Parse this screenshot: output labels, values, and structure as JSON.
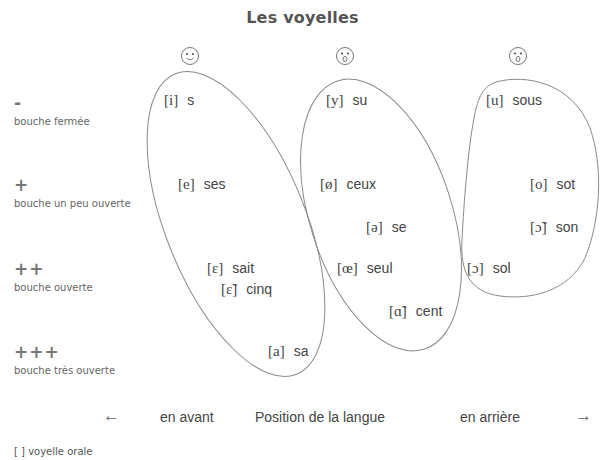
{
  "title": "Les voyelles",
  "faces": [
    {
      "name": "smiling-face-icon",
      "x": 180,
      "y": 46,
      "mouth": "smile"
    },
    {
      "name": "rounded-mouth-face-icon",
      "x": 335,
      "y": 46,
      "mouth": "round"
    },
    {
      "name": "rounded-mouth-face-icon",
      "x": 508,
      "y": 46,
      "mouth": "round"
    }
  ],
  "rows": [
    {
      "symbol": "-",
      "label": "bouche fermée",
      "y": 96
    },
    {
      "symbol": "+",
      "label": "bouche un peu ouverte",
      "y": 178
    },
    {
      "symbol": "++",
      "label": "bouche ouverte",
      "y": 262
    },
    {
      "symbol": "+++",
      "label": "bouche très ouverte",
      "y": 345
    }
  ],
  "groups": [
    {
      "name": "front-unrounded",
      "vowels": [
        {
          "ipa": "[i]",
          "word": "s",
          "x": 164,
          "y": 92
        },
        {
          "ipa": "[e]",
          "word": "ses",
          "x": 178,
          "y": 176
        },
        {
          "ipa": "[ɛ]",
          "word": "sait",
          "x": 207,
          "y": 260
        },
        {
          "ipa": "[ɛ̃]",
          "word": "cinq",
          "x": 221,
          "y": 281
        },
        {
          "ipa": "[a]",
          "word": "sa",
          "x": 268,
          "y": 343
        }
      ]
    },
    {
      "name": "front-rounded",
      "vowels": [
        {
          "ipa": "[y]",
          "word": "su",
          "x": 326,
          "y": 92
        },
        {
          "ipa": "[ø]",
          "word": "ceux",
          "x": 320,
          "y": 176
        },
        {
          "ipa": "[ə]",
          "word": "se",
          "x": 366,
          "y": 219
        },
        {
          "ipa": "[œ]",
          "word": "seul",
          "x": 337,
          "y": 260
        },
        {
          "ipa": "[ɑ̃]",
          "word": "cent",
          "x": 389,
          "y": 303
        }
      ]
    },
    {
      "name": "back-rounded",
      "vowels": [
        {
          "ipa": "[u]",
          "word": "sous",
          "x": 486,
          "y": 92
        },
        {
          "ipa": "[o]",
          "word": "sot",
          "x": 530,
          "y": 176
        },
        {
          "ipa": "[ɔ̃]",
          "word": "son",
          "x": 530,
          "y": 219
        },
        {
          "ipa": "[ɔ]",
          "word": "sol",
          "x": 467,
          "y": 260
        }
      ]
    }
  ],
  "axis": {
    "left_arrow": "←",
    "front": "en avant",
    "title": "Position de la langue",
    "back": "en arrière",
    "right_arrow": "→"
  },
  "legend": "[ ] voyelle orale",
  "colors": {
    "outline": "#8a8a8a",
    "text": "#444444",
    "title": "#555555"
  }
}
